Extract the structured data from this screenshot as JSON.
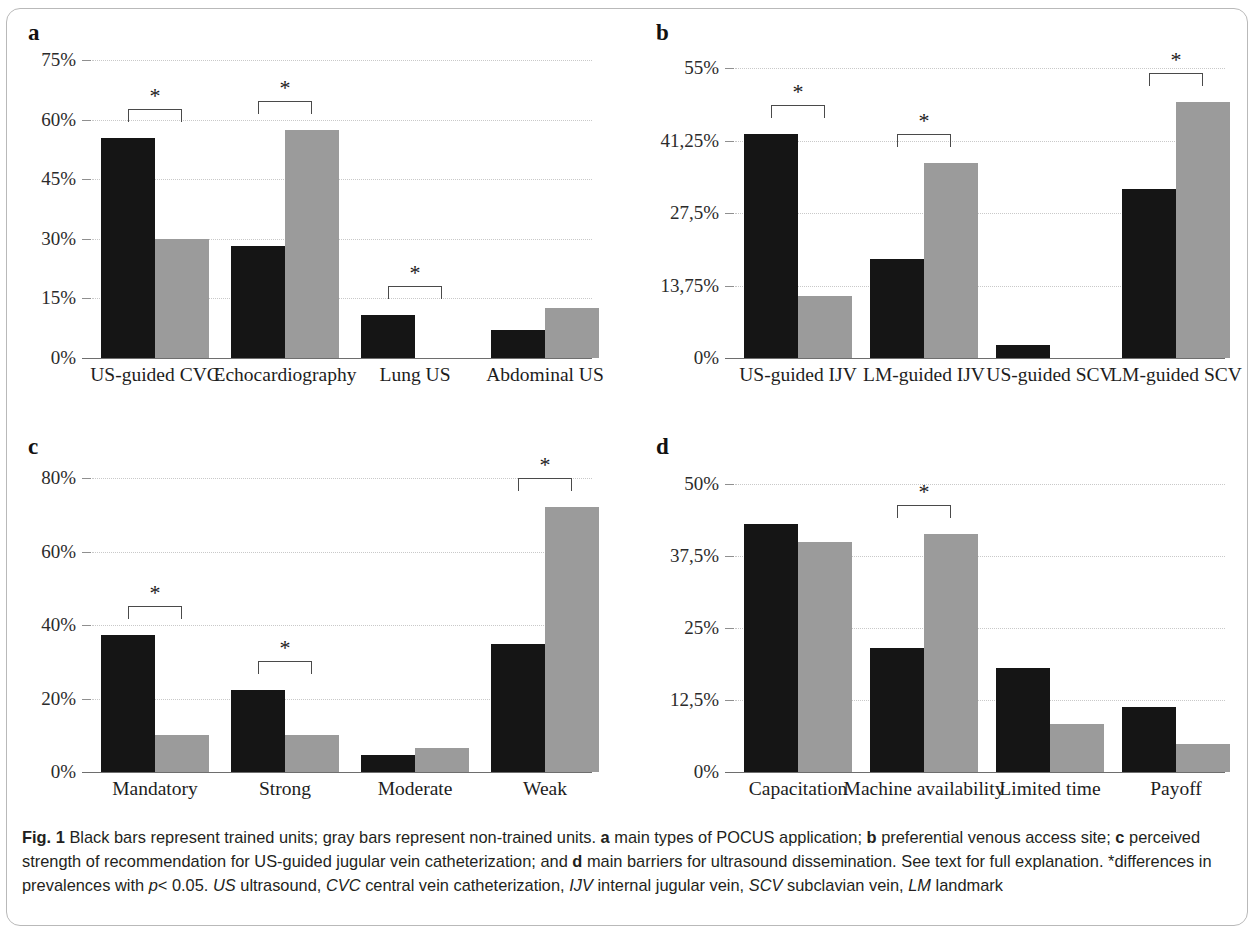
{
  "figure": {
    "label": "Fig. 1",
    "caption_parts": {
      "intro": "Black bars represent trained units; gray bars represent non-trained units.",
      "a_letter": "a",
      "a_text": "main types of POCUS application;",
      "b_letter": "b",
      "b_text": "preferential venous access site;",
      "c_letter": "c",
      "c_text": "perceived strength of recommendation for US-guided jugular vein catheterization; and",
      "d_letter": "d",
      "d_text": "main barriers for ultrasound dissemination. See text for full explanation. *differences in prevalences with",
      "p_italic": "p",
      "p_value": "< 0.05.",
      "abbr_us": "US",
      "abbr_us_def": "ultrasound,",
      "abbr_cvc": "CVC",
      "abbr_cvc_def": "central vein catheterization,",
      "abbr_ijv": "IJV",
      "abbr_ijv_def": "internal jugular vein,",
      "abbr_scv": "SCV",
      "abbr_scv_def": "subclavian vein,",
      "abbr_lm": "LM",
      "abbr_lm_def": "landmark"
    },
    "colors": {
      "trained_black": "#151515",
      "nontrained_gray": "#9b9b9b",
      "gridline": "#c9c9c9",
      "axis": "#6e6e6e",
      "bracket": "#4a4a4a"
    },
    "legend_meaning": {
      "black": "trained units",
      "gray": "non-trained units"
    }
  },
  "chart_data": [
    {
      "panel": "a",
      "type": "bar",
      "title": "main types of POCUS application",
      "xlabel": "",
      "ylabel": "",
      "ylim": [
        0,
        75
      ],
      "yticks": [
        "0%",
        "15%",
        "30%",
        "45%",
        "60%",
        "75%"
      ],
      "ytick_values": [
        0,
        15,
        30,
        45,
        60,
        75
      ],
      "grid": true,
      "legend_position": "none",
      "categories": [
        "US-guided CVC",
        "Echocardiography",
        "Lung US",
        "Abdominal US"
      ],
      "series": [
        {
          "name": "trained units",
          "color": "#151515",
          "values": [
            55.4,
            28.2,
            10.8,
            7.0
          ]
        },
        {
          "name": "non-trained units",
          "color": "#9b9b9b",
          "values": [
            29.9,
            57.3,
            0.0,
            12.7
          ]
        }
      ],
      "significance": [
        {
          "category": "US-guided CVC",
          "marker": "*"
        },
        {
          "category": "Echocardiography",
          "marker": "*"
        },
        {
          "category": "Lung US",
          "marker": "*"
        }
      ]
    },
    {
      "panel": "b",
      "type": "bar",
      "title": "preferential venous access site",
      "xlabel": "",
      "ylabel": "",
      "ylim": [
        0,
        55
      ],
      "yticks": [
        "0%",
        "13,75%",
        "27,5%",
        "41,25%",
        "55%"
      ],
      "ytick_values": [
        0,
        13.75,
        27.5,
        41.25,
        55
      ],
      "grid": true,
      "legend_position": "none",
      "categories": [
        "US-guided IJV",
        "LM-guided IJV",
        "US-guided SCV",
        "LM-guided SCV"
      ],
      "series": [
        {
          "name": "trained units",
          "color": "#151515",
          "values": [
            42.5,
            18.8,
            2.5,
            32.0
          ]
        },
        {
          "name": "non-trained units",
          "color": "#9b9b9b",
          "values": [
            11.8,
            36.9,
            0.0,
            48.5
          ]
        }
      ],
      "significance": [
        {
          "category": "US-guided IJV",
          "marker": "*"
        },
        {
          "category": "LM-guided IJV",
          "marker": "*"
        },
        {
          "category": "LM-guided SCV",
          "marker": "*"
        }
      ]
    },
    {
      "panel": "c",
      "type": "bar",
      "title": "perceived strength of recommendation for US-guided jugular vein catheterization",
      "xlabel": "",
      "ylabel": "",
      "ylim": [
        0,
        80
      ],
      "yticks": [
        "0%",
        "20%",
        "40%",
        "60%",
        "80%"
      ],
      "ytick_values": [
        0,
        20,
        40,
        60,
        80
      ],
      "grid": true,
      "legend_position": "none",
      "categories": [
        "Mandatory",
        "Strong",
        "Moderate",
        "Weak"
      ],
      "series": [
        {
          "name": "trained units",
          "color": "#151515",
          "values": [
            37.4,
            22.4,
            4.7,
            34.8
          ]
        },
        {
          "name": "non-trained units",
          "color": "#9b9b9b",
          "values": [
            10.2,
            10.0,
            6.6,
            72.0
          ]
        }
      ],
      "significance": [
        {
          "category": "Mandatory",
          "marker": "*"
        },
        {
          "category": "Strong",
          "marker": "*"
        },
        {
          "category": "Weak",
          "marker": "*"
        }
      ]
    },
    {
      "panel": "d",
      "type": "bar",
      "title": "main barriers for ultrasound dissemination",
      "xlabel": "",
      "ylabel": "",
      "ylim": [
        0,
        50
      ],
      "yticks": [
        "0%",
        "12,5%",
        "25%",
        "37,5%",
        "50%"
      ],
      "ytick_values": [
        0,
        12.5,
        25,
        37.5,
        50
      ],
      "grid": true,
      "legend_position": "none",
      "categories": [
        "Capacitation",
        "Machine availability",
        "Limited time",
        "Payoff"
      ],
      "series": [
        {
          "name": "trained units",
          "color": "#151515",
          "values": [
            43.0,
            21.5,
            18.0,
            11.3
          ]
        },
        {
          "name": "non-trained units",
          "color": "#9b9b9b",
          "values": [
            40.0,
            41.4,
            8.3,
            4.8
          ]
        }
      ],
      "significance": [
        {
          "category": "Machine availability",
          "marker": "*"
        }
      ]
    }
  ]
}
